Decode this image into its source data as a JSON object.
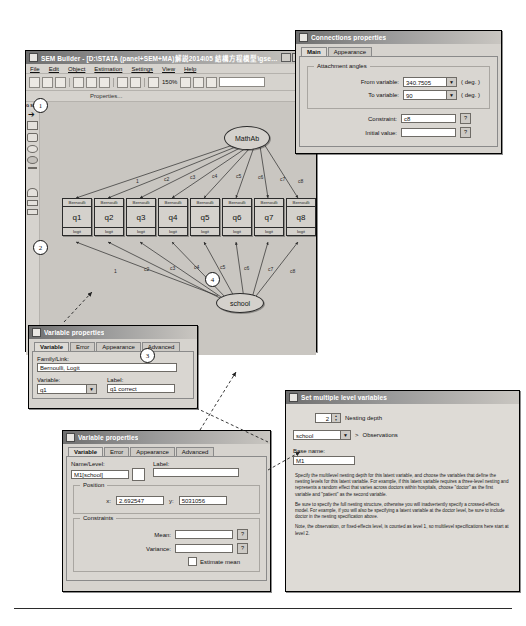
{
  "sem_window": {
    "title": "SEM Builder - [D:\\STATA (panel+SEM+MA)解説2014\\05 結構方程模型\\gsem_mlcfa2",
    "icon": "sem-app-icon",
    "menu": [
      "File",
      "Edit",
      "Object",
      "Estimation",
      "Settings",
      "View",
      "Help"
    ],
    "toolbar": {
      "zoom_level": "150%",
      "properties_label": "Properties...",
      "icons": [
        "new-icon",
        "open-icon",
        "save-icon",
        "print-icon",
        "copy-icon",
        "paste-icon",
        "undo-icon",
        "redo-icon",
        "pointer-icon",
        "fit-icon",
        "refresh-icon",
        "lock-icon"
      ]
    },
    "left_tools": {
      "logo": "G SEM",
      "items": [
        "pointer-tool",
        "rectangle-tool",
        "rounded-rect-tool",
        "ellipse-tool",
        "filled-ellipse-tool",
        "line-tool",
        "path-tool",
        "text-tool",
        "area-tool"
      ]
    }
  },
  "diagram": {
    "latent_top": "MathAb",
    "latent_bottom": "school",
    "observed": [
      {
        "family": "Bernoulli",
        "name": "q1",
        "link": "logit"
      },
      {
        "family": "Bernoulli",
        "name": "q2",
        "link": "logit"
      },
      {
        "family": "Bernoulli",
        "name": "q3",
        "link": "logit"
      },
      {
        "family": "Bernoulli",
        "name": "q4",
        "link": "logit"
      },
      {
        "family": "Bernoulli",
        "name": "q5",
        "link": "logit"
      },
      {
        "family": "Bernoulli",
        "name": "q6",
        "link": "logit"
      },
      {
        "family": "Bernoulli",
        "name": "q7",
        "link": "logit"
      },
      {
        "family": "Bernoulli",
        "name": "q8",
        "link": "logit"
      }
    ],
    "top_path_labels": [
      "1",
      "c2",
      "c3",
      "c4",
      "c5",
      "c6",
      "c7",
      "c8"
    ],
    "bottom_path_labels": [
      "1",
      "c2",
      "c3",
      "c4",
      "c5",
      "c6",
      "c7",
      "c8"
    ]
  },
  "callouts": [
    "1",
    "2",
    "3",
    "4"
  ],
  "connections_properties": {
    "title": "Connections properties",
    "icon": "connections-icon",
    "tabs": [
      {
        "label": "Main",
        "selected": true
      },
      {
        "label": "Appearance",
        "selected": false
      }
    ],
    "group_label": "Attachment angles",
    "from_variable": {
      "label": "From variable:",
      "value": "340.7505",
      "unit": "( deg. )"
    },
    "to_variable": {
      "label": "To variable:",
      "value": "90",
      "unit": "( deg. )"
    },
    "constraint": {
      "label": "Constraint:",
      "value": "c8",
      "help": "?"
    },
    "initial_value": {
      "label": "Initial value:",
      "value": "",
      "help": "?"
    }
  },
  "variable_properties_1": {
    "title": "Variable properties",
    "icon": "variable-icon",
    "tabs": [
      {
        "label": "Variable",
        "selected": true
      },
      {
        "label": "Error",
        "selected": false
      },
      {
        "label": "Appearance",
        "selected": false
      },
      {
        "label": "Advanced",
        "selected": false
      }
    ],
    "family_link": {
      "label": "Family/Link:",
      "value": "Bernoulli, Logit"
    },
    "variable": {
      "label": "Variable:",
      "value": "q1"
    },
    "var_label": {
      "label": "Label:",
      "value": "q1 correct"
    }
  },
  "variable_properties_2": {
    "title": "Variable properties",
    "icon": "variable-icon",
    "tabs": [
      {
        "label": "Variable",
        "selected": true
      },
      {
        "label": "Error",
        "selected": false
      },
      {
        "label": "Appearance",
        "selected": false
      },
      {
        "label": "Advanced",
        "selected": false
      }
    ],
    "name_level": {
      "label": "Name/Level:",
      "value": "M1[school]"
    },
    "name_label": {
      "label": "Label:",
      "value": ""
    },
    "position": {
      "group": "Position",
      "x_label": "x:",
      "x_value": "2.692547",
      "y_label": "y:",
      "y_value": "5031056"
    },
    "constraints": {
      "group": "Constraints",
      "mean_label": "Mean:",
      "mean_value": "",
      "mean_help": "?",
      "variance_label": "Variance:",
      "variance_value": "",
      "variance_help": "?",
      "estimate_mean_label": "Estimate mean"
    }
  },
  "multilevel": {
    "title": "Set multiple level variables",
    "icon": "multilevel-icon",
    "nesting_depth": {
      "value": "2",
      "label": "Nesting depth"
    },
    "level_select": {
      "value": "school",
      "arrow": ">",
      "suffix": "Observations"
    },
    "base_name": {
      "label": "Base name:",
      "value": "M1"
    },
    "help_paragraphs": [
      "Specify the multilevel nesting depth for this latent variable, and choose the variables that define the nesting levels for this latent variable. For example, if this latent variable requires a three-level nesting and represents a random effect that varies across doctors within hospitals, choose \"doctor\" as the first variable and \"patient\" as the second variable.",
      "Be sure to specify the full nesting structure, otherwise you will inadvertently specify a crossed-effects model. For example, if you will also be specifying a latent variable at the doctor level, be sure to include doctor in the nesting specification above.",
      "Note, the observation, or fixed-effects level, is counted as level 1, so multilevel specifications here start at level 2."
    ]
  }
}
